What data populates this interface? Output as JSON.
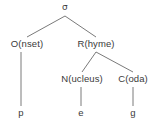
{
  "diagram": {
    "type": "syllable-structure-tree",
    "colors": {
      "background": "#ffffff",
      "text": "#3a3a3a",
      "line": "#7a7a7a"
    },
    "nodes": [
      {
        "id": "sigma",
        "label": "σ",
        "x": 65,
        "y": 9,
        "level": 0,
        "role": "syllable-root"
      },
      {
        "id": "onset",
        "label": "O(nset)",
        "x": 27,
        "y": 45,
        "level": 1,
        "role": "onset"
      },
      {
        "id": "rhyme",
        "label": "R(hyme)",
        "x": 96,
        "y": 45,
        "level": 1,
        "role": "rhyme"
      },
      {
        "id": "nucleus",
        "label": "N(ucleus)",
        "x": 82,
        "y": 80,
        "level": 2,
        "role": "nucleus"
      },
      {
        "id": "coda",
        "label": "C(oda)",
        "x": 133,
        "y": 80,
        "level": 2,
        "role": "coda"
      },
      {
        "id": "seg-p",
        "label": "p",
        "x": 21,
        "y": 113,
        "level": 3,
        "role": "segment"
      },
      {
        "id": "seg-e",
        "label": "e",
        "x": 81,
        "y": 113,
        "level": 3,
        "role": "segment"
      },
      {
        "id": "seg-g",
        "label": "g",
        "x": 133,
        "y": 113,
        "level": 3,
        "role": "segment"
      }
    ],
    "edges": [
      {
        "id": "edge-sigma-onset",
        "from": "sigma",
        "to": "onset",
        "x1": 65,
        "y1": 16,
        "x2": 27,
        "y2": 37
      },
      {
        "id": "edge-sigma-rhyme",
        "from": "sigma",
        "to": "rhyme",
        "x1": 65,
        "y1": 16,
        "x2": 96,
        "y2": 37
      },
      {
        "id": "edge-onset-p",
        "from": "onset",
        "to": "seg-p",
        "x1": 21,
        "y1": 52,
        "x2": 21,
        "y2": 106
      },
      {
        "id": "edge-rhyme-nucleus",
        "from": "rhyme",
        "to": "nucleus",
        "x1": 96,
        "y1": 52,
        "x2": 82,
        "y2": 72
      },
      {
        "id": "edge-rhyme-coda",
        "from": "rhyme",
        "to": "coda",
        "x1": 96,
        "y1": 52,
        "x2": 133,
        "y2": 72
      },
      {
        "id": "edge-nucleus-e",
        "from": "nucleus",
        "to": "seg-e",
        "x1": 81,
        "y1": 87,
        "x2": 81,
        "y2": 106
      },
      {
        "id": "edge-coda-g",
        "from": "coda",
        "to": "seg-g",
        "x1": 133,
        "y1": 87,
        "x2": 133,
        "y2": 106
      }
    ],
    "word": "peg"
  }
}
